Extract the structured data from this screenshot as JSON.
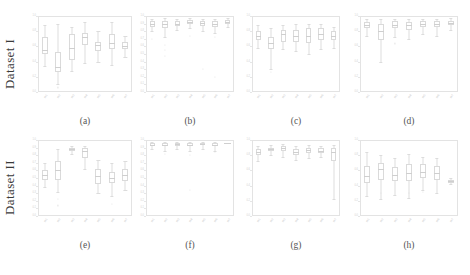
{
  "figure": {
    "background": "#ffffff",
    "grid": {
      "rows": 2,
      "cols": 4
    },
    "row_labels": [
      "Dataset I",
      "Dataset II"
    ],
    "box_edge_color": "#dadada",
    "box_face_color": "#ffffff",
    "median_color": "#cfcfcf",
    "axis_color": "#e3e3e3",
    "tick_label_color": "#c9c9c9"
  },
  "chart_data": [
    {
      "type": "box",
      "panel": "a",
      "caption": "(a)",
      "row": "Dataset I",
      "title": "",
      "xlabel": "",
      "ylabel": "",
      "grid": false,
      "legend": null,
      "ylim": [
        0.0,
        1.0
      ],
      "yticks": [
        "0.0",
        "0.2",
        "0.4",
        "0.6",
        "0.8",
        "1.0"
      ],
      "categories": [
        "m1",
        "m2",
        "m3",
        "m4",
        "m5",
        "m6",
        "m7"
      ],
      "boxes": [
        {
          "whislo": 0.34,
          "q1": 0.5,
          "med": 0.55,
          "q3": 0.72,
          "whishi": 0.88,
          "fliers": []
        },
        {
          "whislo": 0.1,
          "q1": 0.26,
          "med": 0.33,
          "q3": 0.52,
          "whishi": 0.9,
          "fliers": [
            0.06
          ]
        },
        {
          "whislo": 0.28,
          "q1": 0.42,
          "med": 0.58,
          "q3": 0.76,
          "whishi": 0.86,
          "fliers": []
        },
        {
          "whislo": 0.38,
          "q1": 0.62,
          "med": 0.72,
          "q3": 0.78,
          "whishi": 0.92,
          "fliers": []
        },
        {
          "whislo": 0.4,
          "q1": 0.54,
          "med": 0.62,
          "q3": 0.66,
          "whishi": 0.8,
          "fliers": []
        },
        {
          "whislo": 0.36,
          "q1": 0.56,
          "med": 0.64,
          "q3": 0.76,
          "whishi": 0.92,
          "fliers": []
        },
        {
          "whislo": 0.46,
          "q1": 0.56,
          "med": 0.6,
          "q3": 0.66,
          "whishi": 0.74,
          "fliers": []
        }
      ]
    },
    {
      "type": "box",
      "panel": "b",
      "caption": "(b)",
      "row": "Dataset I",
      "title": "",
      "xlabel": "",
      "ylabel": "",
      "grid": false,
      "legend": null,
      "ylim": [
        0.0,
        1.0
      ],
      "yticks": [
        "0.0",
        "0.1",
        "0.2",
        "0.3",
        "0.4",
        "0.5",
        "0.6",
        "0.7",
        "0.8",
        "0.9",
        "1.0"
      ],
      "categories": [
        "m1",
        "m2",
        "m3",
        "m4",
        "m5",
        "m6",
        "m7"
      ],
      "boxes": [
        {
          "whislo": 0.8,
          "q1": 0.86,
          "med": 0.9,
          "q3": 0.93,
          "whishi": 0.96,
          "fliers": [
            0.7
          ]
        },
        {
          "whislo": 0.72,
          "q1": 0.84,
          "med": 0.9,
          "q3": 0.94,
          "whishi": 0.97,
          "fliers": [
            0.62,
            0.55,
            0.48
          ]
        },
        {
          "whislo": 0.82,
          "q1": 0.87,
          "med": 0.9,
          "q3": 0.94,
          "whishi": 0.96,
          "fliers": []
        },
        {
          "whislo": 0.84,
          "q1": 0.89,
          "med": 0.92,
          "q3": 0.95,
          "whishi": 0.97,
          "fliers": [
            0.74
          ]
        },
        {
          "whislo": 0.8,
          "q1": 0.87,
          "med": 0.91,
          "q3": 0.94,
          "whishi": 0.96,
          "fliers": [
            0.3
          ]
        },
        {
          "whislo": 0.78,
          "q1": 0.86,
          "med": 0.9,
          "q3": 0.94,
          "whishi": 0.96,
          "fliers": [
            0.72,
            0.2
          ]
        },
        {
          "whislo": 0.86,
          "q1": 0.9,
          "med": 0.92,
          "q3": 0.95,
          "whishi": 0.97,
          "fliers": []
        }
      ]
    },
    {
      "type": "box",
      "panel": "c",
      "caption": "(c)",
      "row": "Dataset I",
      "title": "",
      "xlabel": "",
      "ylabel": "",
      "grid": false,
      "legend": null,
      "ylim": [
        0.0,
        1.0
      ],
      "yticks": [
        "0.0",
        "0.2",
        "0.4",
        "0.6",
        "0.8",
        "1.0"
      ],
      "categories": [
        "m1",
        "m2",
        "m3",
        "m4",
        "m5",
        "m6",
        "m7"
      ],
      "boxes": [
        {
          "whislo": 0.58,
          "q1": 0.68,
          "med": 0.74,
          "q3": 0.8,
          "whishi": 0.88,
          "fliers": []
        },
        {
          "whislo": 0.3,
          "q1": 0.56,
          "med": 0.64,
          "q3": 0.72,
          "whishi": 0.84,
          "fliers": [
            0.26
          ]
        },
        {
          "whislo": 0.56,
          "q1": 0.66,
          "med": 0.76,
          "q3": 0.82,
          "whishi": 0.88,
          "fliers": []
        },
        {
          "whislo": 0.54,
          "q1": 0.66,
          "med": 0.74,
          "q3": 0.82,
          "whishi": 0.9,
          "fliers": []
        },
        {
          "whislo": 0.5,
          "q1": 0.64,
          "med": 0.74,
          "q3": 0.84,
          "whishi": 0.9,
          "fliers": []
        },
        {
          "whislo": 0.56,
          "q1": 0.68,
          "med": 0.76,
          "q3": 0.84,
          "whishi": 0.9,
          "fliers": []
        },
        {
          "whislo": 0.58,
          "q1": 0.68,
          "med": 0.74,
          "q3": 0.8,
          "whishi": 0.86,
          "fliers": []
        }
      ]
    },
    {
      "type": "box",
      "panel": "d",
      "caption": "(d)",
      "row": "Dataset I",
      "title": "",
      "xlabel": "",
      "ylabel": "",
      "grid": false,
      "legend": null,
      "ylim": [
        0.0,
        1.0
      ],
      "yticks": [
        "0.0",
        "0.2",
        "0.4",
        "0.6",
        "0.8",
        "1.0"
      ],
      "categories": [
        "m1",
        "m2",
        "m3",
        "m4",
        "m5",
        "m6",
        "m7"
      ],
      "boxes": [
        {
          "whislo": 0.74,
          "q1": 0.84,
          "med": 0.88,
          "q3": 0.92,
          "whishi": 0.96,
          "fliers": []
        },
        {
          "whislo": 0.4,
          "q1": 0.68,
          "med": 0.8,
          "q3": 0.9,
          "whishi": 0.96,
          "fliers": []
        },
        {
          "whislo": 0.72,
          "q1": 0.84,
          "med": 0.88,
          "q3": 0.93,
          "whishi": 0.96,
          "fliers": [
            0.64
          ]
        },
        {
          "whislo": 0.7,
          "q1": 0.82,
          "med": 0.88,
          "q3": 0.92,
          "whishi": 0.96,
          "fliers": []
        },
        {
          "whislo": 0.76,
          "q1": 0.85,
          "med": 0.89,
          "q3": 0.93,
          "whishi": 0.96,
          "fliers": []
        },
        {
          "whislo": 0.74,
          "q1": 0.85,
          "med": 0.89,
          "q3": 0.93,
          "whishi": 0.96,
          "fliers": []
        },
        {
          "whislo": 0.82,
          "q1": 0.88,
          "med": 0.91,
          "q3": 0.94,
          "whishi": 0.97,
          "fliers": []
        }
      ]
    },
    {
      "type": "box",
      "panel": "e",
      "caption": "(e)",
      "row": "Dataset II",
      "title": "",
      "xlabel": "",
      "ylabel": "",
      "grid": false,
      "legend": null,
      "ylim": [
        0.0,
        1.0
      ],
      "yticks": [
        "0.0",
        "0.1",
        "0.2",
        "0.3",
        "0.4",
        "0.5",
        "0.6",
        "0.7",
        "0.8",
        "0.9",
        "1.0"
      ],
      "categories": [
        "m1",
        "m2",
        "m3",
        "m4",
        "m5",
        "m6",
        "m7"
      ],
      "boxes": [
        {
          "whislo": 0.38,
          "q1": 0.48,
          "med": 0.54,
          "q3": 0.6,
          "whishi": 0.7,
          "fliers": []
        },
        {
          "whislo": 0.32,
          "q1": 0.48,
          "med": 0.6,
          "q3": 0.72,
          "whishi": 0.88,
          "fliers": [
            0.22,
            0.14
          ]
        },
        {
          "whislo": 0.82,
          "q1": 0.86,
          "med": 0.88,
          "q3": 0.9,
          "whishi": 0.92,
          "fliers": []
        },
        {
          "whislo": 0.62,
          "q1": 0.76,
          "med": 0.86,
          "q3": 0.9,
          "whishi": 0.92,
          "fliers": []
        },
        {
          "whislo": 0.3,
          "q1": 0.42,
          "med": 0.52,
          "q3": 0.62,
          "whishi": 0.74,
          "fliers": []
        },
        {
          "whislo": 0.26,
          "q1": 0.44,
          "med": 0.5,
          "q3": 0.58,
          "whishi": 0.7,
          "fliers": [
            0.16
          ]
        },
        {
          "whislo": 0.34,
          "q1": 0.46,
          "med": 0.54,
          "q3": 0.62,
          "whishi": 0.72,
          "fliers": []
        }
      ]
    },
    {
      "type": "box",
      "panel": "f",
      "caption": "(f)",
      "row": "Dataset II",
      "title": "",
      "xlabel": "",
      "ylabel": "",
      "grid": false,
      "legend": null,
      "ylim": [
        0.0,
        1.0
      ],
      "yticks": [
        "0.0",
        "0.1",
        "0.2",
        "0.3",
        "0.4",
        "0.5",
        "0.6",
        "0.7",
        "0.8",
        "0.9",
        "1.0"
      ],
      "categories": [
        "m1",
        "m2",
        "m3",
        "m4",
        "m5",
        "m6",
        "m7"
      ],
      "boxes": [
        {
          "whislo": 0.88,
          "q1": 0.92,
          "med": 0.94,
          "q3": 0.96,
          "whishi": 0.98,
          "fliers": []
        },
        {
          "whislo": 0.86,
          "q1": 0.92,
          "med": 0.94,
          "q3": 0.96,
          "whishi": 0.98,
          "fliers": [
            0.82
          ]
        },
        {
          "whislo": 0.88,
          "q1": 0.92,
          "med": 0.95,
          "q3": 0.96,
          "whishi": 0.98,
          "fliers": []
        },
        {
          "whislo": 0.86,
          "q1": 0.92,
          "med": 0.94,
          "q3": 0.96,
          "whishi": 0.98,
          "fliers": [
            0.8,
            0.34
          ]
        },
        {
          "whislo": 0.88,
          "q1": 0.93,
          "med": 0.95,
          "q3": 0.96,
          "whishi": 0.98,
          "fliers": []
        },
        {
          "whislo": 0.86,
          "q1": 0.92,
          "med": 0.94,
          "q3": 0.96,
          "whishi": 0.98,
          "fliers": [
            0.84
          ]
        },
        {
          "whislo": 0.96,
          "q1": 0.96,
          "med": 0.96,
          "q3": 0.96,
          "whishi": 0.96,
          "fliers": []
        }
      ]
    },
    {
      "type": "box",
      "panel": "g",
      "caption": "(g)",
      "row": "Dataset II",
      "title": "",
      "xlabel": "",
      "ylabel": "",
      "grid": false,
      "legend": null,
      "ylim": [
        0.0,
        1.0
      ],
      "yticks": [
        "0.0",
        "0.2",
        "0.4",
        "0.6",
        "0.8",
        "1.0"
      ],
      "categories": [
        "m1",
        "m2",
        "m3",
        "m4",
        "m5",
        "m6",
        "m7"
      ],
      "boxes": [
        {
          "whislo": 0.72,
          "q1": 0.8,
          "med": 0.84,
          "q3": 0.88,
          "whishi": 0.92,
          "fliers": []
        },
        {
          "whislo": 0.8,
          "q1": 0.86,
          "med": 0.88,
          "q3": 0.9,
          "whishi": 0.93,
          "fliers": []
        },
        {
          "whislo": 0.78,
          "q1": 0.85,
          "med": 0.89,
          "q3": 0.92,
          "whishi": 0.95,
          "fliers": []
        },
        {
          "whislo": 0.74,
          "q1": 0.8,
          "med": 0.84,
          "q3": 0.88,
          "whishi": 0.92,
          "fliers": []
        },
        {
          "whislo": 0.76,
          "q1": 0.83,
          "med": 0.87,
          "q3": 0.9,
          "whishi": 0.94,
          "fliers": []
        },
        {
          "whislo": 0.78,
          "q1": 0.83,
          "med": 0.86,
          "q3": 0.89,
          "whishi": 0.92,
          "fliers": []
        },
        {
          "whislo": 0.22,
          "q1": 0.72,
          "med": 0.84,
          "q3": 0.9,
          "whishi": 0.94,
          "fliers": []
        }
      ]
    },
    {
      "type": "box",
      "panel": "h",
      "caption": "(h)",
      "row": "Dataset II",
      "title": "",
      "xlabel": "",
      "ylabel": "",
      "grid": false,
      "legend": null,
      "ylim": [
        0.0,
        1.0
      ],
      "yticks": [
        "0.0",
        "0.2",
        "0.4",
        "0.6",
        "0.8",
        "1.0"
      ],
      "categories": [
        "m1",
        "m2",
        "m3",
        "m4",
        "m5",
        "m6",
        "m7"
      ],
      "boxes": [
        {
          "whislo": 0.26,
          "q1": 0.44,
          "med": 0.52,
          "q3": 0.66,
          "whishi": 0.84,
          "fliers": []
        },
        {
          "whislo": 0.22,
          "q1": 0.48,
          "med": 0.62,
          "q3": 0.7,
          "whishi": 0.8,
          "fliers": [
            0.3
          ]
        },
        {
          "whislo": 0.28,
          "q1": 0.46,
          "med": 0.54,
          "q3": 0.64,
          "whishi": 0.76,
          "fliers": []
        },
        {
          "whislo": 0.24,
          "q1": 0.46,
          "med": 0.56,
          "q3": 0.68,
          "whishi": 0.82,
          "fliers": [
            0.3
          ]
        },
        {
          "whislo": 0.34,
          "q1": 0.5,
          "med": 0.58,
          "q3": 0.68,
          "whishi": 0.78,
          "fliers": [
            0.32
          ]
        },
        {
          "whislo": 0.3,
          "q1": 0.48,
          "med": 0.56,
          "q3": 0.66,
          "whishi": 0.76,
          "fliers": []
        },
        {
          "whislo": 0.42,
          "q1": 0.44,
          "med": 0.46,
          "q3": 0.48,
          "whishi": 0.5,
          "fliers": []
        }
      ]
    }
  ]
}
